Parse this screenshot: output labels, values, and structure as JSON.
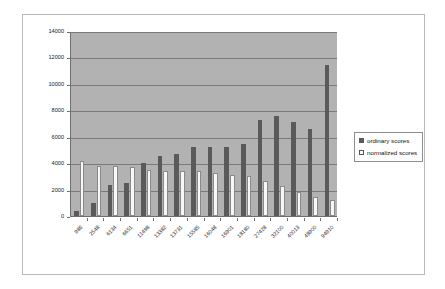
{
  "chart_data": {
    "type": "bar",
    "title": "",
    "subtitle": "",
    "xlabel": "",
    "ylabel": "",
    "ylim": [
      0,
      14000
    ],
    "ytick_step": 2000,
    "yticks": [
      "0",
      "2000",
      "4000",
      "6000",
      "8000",
      "10000",
      "12000",
      "14000"
    ],
    "grid": true,
    "legend_position": "right",
    "categories": [
      "986",
      "2548",
      "6134",
      "6651",
      "11498",
      "13382",
      "13731",
      "15585",
      "16048",
      "16901",
      "18180",
      "27428",
      "32100",
      "40013",
      "48900",
      "94910"
    ],
    "series": [
      {
        "name": "ordinary scores",
        "color": "#5a5a5a",
        "values": [
          400,
          1000,
          2350,
          2500,
          4000,
          4550,
          4680,
          5250,
          5250,
          5250,
          5450,
          7250,
          7550,
          7150,
          6600,
          11450
        ]
      },
      {
        "name": "normalized scores",
        "color": "#f7f7f7",
        "values": [
          4150,
          3800,
          3800,
          3700,
          3480,
          3380,
          3380,
          3400,
          3270,
          3100,
          3020,
          2620,
          2270,
          1800,
          1420,
          1180
        ]
      }
    ]
  },
  "legend": {
    "entries": [
      {
        "label": "ordinary scores",
        "swatch": "filled-square-icon"
      },
      {
        "label": "normalized scores",
        "swatch": "empty-square-icon"
      }
    ]
  },
  "colors": {
    "plot_background": "#b2b2b2",
    "frame_border": "#b9b9b9",
    "axis": "#6f6f6f",
    "gridline": "#7a7a7a",
    "ordinary_bar": "#5a5a5a",
    "normalized_bar": "#f7f7f7"
  }
}
